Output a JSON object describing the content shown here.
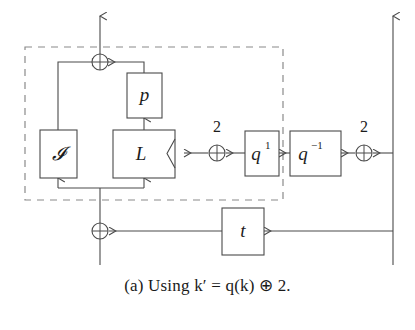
{
  "figure": {
    "label": "(a)",
    "caption_prefix": "(a)",
    "caption_word": "Using",
    "caption_math": "k′ = q(k) ⊕ 2.",
    "caption_full": "(a) Using k′ = q(k) ⊕ 2.",
    "background_color": "#ffffff",
    "line_color": "#4a4a4a",
    "dashed_color": "#8a8a8a",
    "text_color": "#1c1c1c"
  },
  "blocks": {
    "identity": {
      "label": "𝓘",
      "name": "I"
    },
    "linear": {
      "label": "L"
    },
    "permutation": {
      "label": "p"
    },
    "q_forward": {
      "base": "q",
      "exponent": "1"
    },
    "q_inverse": {
      "base": "q",
      "exponent": "−1"
    },
    "tweak": {
      "label": "t"
    }
  },
  "operators": {
    "xor_symbol": "⊕",
    "xor_top": {
      "name": "xor-top"
    },
    "xor_bottom": {
      "name": "xor-bottom"
    },
    "xor_middle": {
      "name": "xor-middle"
    },
    "xor_right": {
      "name": "xor-right"
    }
  },
  "edge_labels": {
    "constant_middle": "2",
    "constant_right": "2"
  }
}
